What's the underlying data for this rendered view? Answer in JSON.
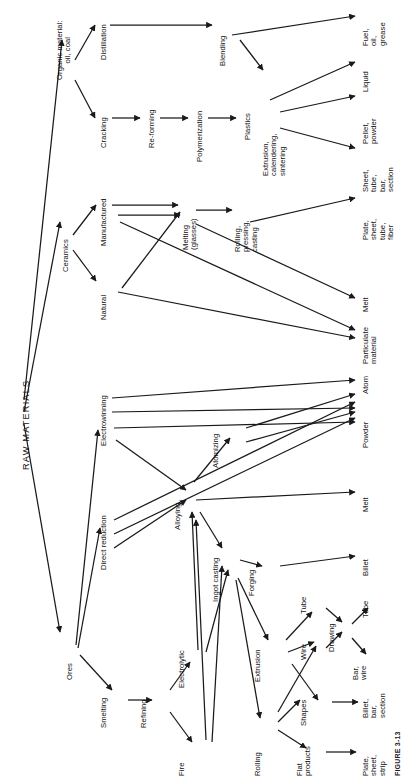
{
  "figure": {
    "caption": "FIGURE 3-13",
    "orientation": "rotated-90",
    "ink_color": "#1a1a1a",
    "background": "#ffffff"
  },
  "root": {
    "label": "RAW MATERIALS"
  },
  "nodes": {
    "organic": "Organic material:\noil, coal",
    "distillation": "Distillation",
    "cracking": "Cracking",
    "reforming": "Re-forming",
    "polymerization": "Polymerization",
    "blending": "Blending",
    "plastics": "Plastics",
    "extrusion_cal": "Extrusion,\ncalendering,\nsintering",
    "ceramics": "Ceramics",
    "manufactured": "Manufactured",
    "natural": "Natural",
    "melting_glasses": "Melting\n(glasses)",
    "rolling_pressing": "Rolling,\npressing,\ncasting",
    "ores": "Ores",
    "electrowinning": "Electrowinning",
    "direct_reduction": "Direct reduction",
    "smelting": "Smelting",
    "refining": "Refining",
    "electrolytic": "Electrolytic",
    "fire": "Fire",
    "alloying": "Alloying",
    "atomizing": "Atomizing",
    "ingot_casting": "Ingot casting",
    "forging": "Forging",
    "extrusion": "Extrusion",
    "rolling": "Rolling",
    "wire": "Wire",
    "tube": "Tube",
    "drawing": "Drawing",
    "shapes": "Shapes",
    "flat_products": "Flat\nproducts"
  },
  "outputs": {
    "fuel_oil_grease": "Fuel,\noil,\ngrease",
    "liquid": "Liquid",
    "pellet_powder": "Pellet,\npowder",
    "sheet_tube_bar_section": "Sheet,\ntube,\nbar,\nsection",
    "plate_sheet_tube_fiber": "Plate,\nsheet,\ntube,\nfiber",
    "melt_ceramic": "Melt",
    "particulate_material": "Particulate\nmaterial",
    "atom": "Atom",
    "powder": "Powder",
    "melt_metal": "Melt",
    "billet": "Billet",
    "tube_out": "Tube",
    "bar_wire": "Bar,\nwire",
    "billet_bar_section": "Billet,\nbar,\nsection",
    "plate_sheet_strip": "Plate,\nsheet,\nstrip"
  }
}
